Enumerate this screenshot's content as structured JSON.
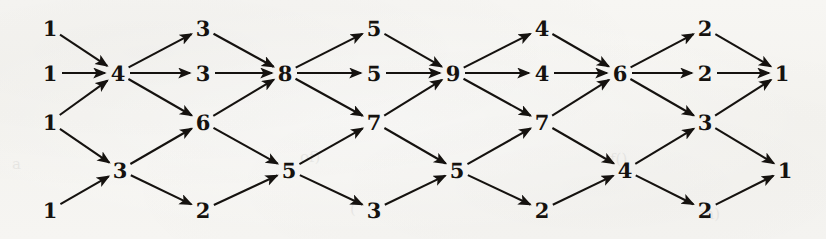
{
  "figure": {
    "kind": "directed-acyclic-graph",
    "title": "",
    "background_color": "#f6f5f2",
    "ink_color": "#15120f",
    "width": 826,
    "height": 239
  },
  "chart_data": {
    "type": "diagram",
    "title": "",
    "xlabel": "",
    "ylabel": "",
    "layout": "layered left-to-right, 10 columns",
    "columns": [
      {
        "index": 0,
        "x": 50,
        "labels": [
          "1",
          "1",
          "1",
          "1"
        ]
      },
      {
        "index": 1,
        "x": 118,
        "labels": [
          "4",
          "3"
        ]
      },
      {
        "index": 2,
        "x": 203,
        "labels": [
          "3",
          "3",
          "6",
          "2"
        ]
      },
      {
        "index": 3,
        "x": 285,
        "labels": [
          "8",
          "5"
        ]
      },
      {
        "index": 4,
        "x": 374,
        "labels": [
          "5",
          "5",
          "7",
          "3"
        ]
      },
      {
        "index": 5,
        "x": 453,
        "labels": [
          "9",
          "5"
        ]
      },
      {
        "index": 6,
        "x": 542,
        "labels": [
          "4",
          "4",
          "7",
          "2"
        ]
      },
      {
        "index": 7,
        "x": 620,
        "labels": [
          "6",
          "4"
        ]
      },
      {
        "index": 8,
        "x": 705,
        "labels": [
          "2",
          "2",
          "3",
          "2"
        ]
      },
      {
        "index": 9,
        "x": 782,
        "labels": [
          "1",
          "1"
        ]
      }
    ],
    "nodes": [
      {
        "id": "n0",
        "label": "1",
        "x": 50,
        "y": 28
      },
      {
        "id": "n1",
        "label": "1",
        "x": 50,
        "y": 73
      },
      {
        "id": "n2",
        "label": "1",
        "x": 50,
        "y": 122
      },
      {
        "id": "n3",
        "label": "1",
        "x": 50,
        "y": 210
      },
      {
        "id": "n4",
        "label": "4",
        "x": 118,
        "y": 73
      },
      {
        "id": "n5",
        "label": "3",
        "x": 120,
        "y": 170
      },
      {
        "id": "n6",
        "label": "3",
        "x": 203,
        "y": 28
      },
      {
        "id": "n7",
        "label": "3",
        "x": 203,
        "y": 73
      },
      {
        "id": "n8",
        "label": "6",
        "x": 203,
        "y": 122
      },
      {
        "id": "n9",
        "label": "2",
        "x": 203,
        "y": 210
      },
      {
        "id": "n10",
        "label": "8",
        "x": 285,
        "y": 73
      },
      {
        "id": "n11",
        "label": "5",
        "x": 289,
        "y": 170
      },
      {
        "id": "n12",
        "label": "5",
        "x": 374,
        "y": 28
      },
      {
        "id": "n13",
        "label": "5",
        "x": 374,
        "y": 73
      },
      {
        "id": "n14",
        "label": "7",
        "x": 374,
        "y": 122
      },
      {
        "id": "n15",
        "label": "3",
        "x": 374,
        "y": 210
      },
      {
        "id": "n16",
        "label": "9",
        "x": 453,
        "y": 73
      },
      {
        "id": "n17",
        "label": "5",
        "x": 457,
        "y": 170
      },
      {
        "id": "n18",
        "label": "4",
        "x": 542,
        "y": 28
      },
      {
        "id": "n19",
        "label": "4",
        "x": 542,
        "y": 73
      },
      {
        "id": "n20",
        "label": "7",
        "x": 542,
        "y": 122
      },
      {
        "id": "n21",
        "label": "2",
        "x": 542,
        "y": 210
      },
      {
        "id": "n22",
        "label": "6",
        "x": 620,
        "y": 73
      },
      {
        "id": "n23",
        "label": "4",
        "x": 625,
        "y": 170
      },
      {
        "id": "n24",
        "label": "2",
        "x": 705,
        "y": 28
      },
      {
        "id": "n25",
        "label": "2",
        "x": 705,
        "y": 73
      },
      {
        "id": "n26",
        "label": "3",
        "x": 705,
        "y": 122
      },
      {
        "id": "n27",
        "label": "2",
        "x": 705,
        "y": 210
      },
      {
        "id": "n28",
        "label": "1",
        "x": 782,
        "y": 73
      },
      {
        "id": "n29",
        "label": "1",
        "x": 785,
        "y": 170
      }
    ],
    "edges": [
      {
        "from": "n0",
        "to": "n4"
      },
      {
        "from": "n1",
        "to": "n4"
      },
      {
        "from": "n2",
        "to": "n4"
      },
      {
        "from": "n2",
        "to": "n5"
      },
      {
        "from": "n3",
        "to": "n5"
      },
      {
        "from": "n4",
        "to": "n6"
      },
      {
        "from": "n4",
        "to": "n7"
      },
      {
        "from": "n4",
        "to": "n8"
      },
      {
        "from": "n5",
        "to": "n8"
      },
      {
        "from": "n5",
        "to": "n9"
      },
      {
        "from": "n6",
        "to": "n10"
      },
      {
        "from": "n7",
        "to": "n10"
      },
      {
        "from": "n8",
        "to": "n10"
      },
      {
        "from": "n8",
        "to": "n11"
      },
      {
        "from": "n9",
        "to": "n11"
      },
      {
        "from": "n10",
        "to": "n12"
      },
      {
        "from": "n10",
        "to": "n13"
      },
      {
        "from": "n10",
        "to": "n14"
      },
      {
        "from": "n11",
        "to": "n14"
      },
      {
        "from": "n11",
        "to": "n15"
      },
      {
        "from": "n12",
        "to": "n16"
      },
      {
        "from": "n13",
        "to": "n16"
      },
      {
        "from": "n14",
        "to": "n16"
      },
      {
        "from": "n14",
        "to": "n17"
      },
      {
        "from": "n15",
        "to": "n17"
      },
      {
        "from": "n16",
        "to": "n18"
      },
      {
        "from": "n16",
        "to": "n19"
      },
      {
        "from": "n16",
        "to": "n20"
      },
      {
        "from": "n17",
        "to": "n20"
      },
      {
        "from": "n17",
        "to": "n21"
      },
      {
        "from": "n18",
        "to": "n22"
      },
      {
        "from": "n19",
        "to": "n22"
      },
      {
        "from": "n20",
        "to": "n22"
      },
      {
        "from": "n20",
        "to": "n23"
      },
      {
        "from": "n21",
        "to": "n23"
      },
      {
        "from": "n22",
        "to": "n24"
      },
      {
        "from": "n22",
        "to": "n25"
      },
      {
        "from": "n22",
        "to": "n26"
      },
      {
        "from": "n23",
        "to": "n26"
      },
      {
        "from": "n23",
        "to": "n27"
      },
      {
        "from": "n24",
        "to": "n28"
      },
      {
        "from": "n25",
        "to": "n28"
      },
      {
        "from": "n26",
        "to": "n28"
      },
      {
        "from": "n26",
        "to": "n29"
      },
      {
        "from": "n27",
        "to": "n29"
      }
    ]
  },
  "bleed_through": [
    {
      "text": "a",
      "x": 12,
      "y": 155
    },
    {
      "text": "of)",
      "x": 300,
      "y": 148
    },
    {
      "text": "(",
      "x": 350,
      "y": 200
    },
    {
      "text": "f()",
      "x": 610,
      "y": 150
    },
    {
      "text": "m)",
      "x": 700,
      "y": 205
    }
  ]
}
